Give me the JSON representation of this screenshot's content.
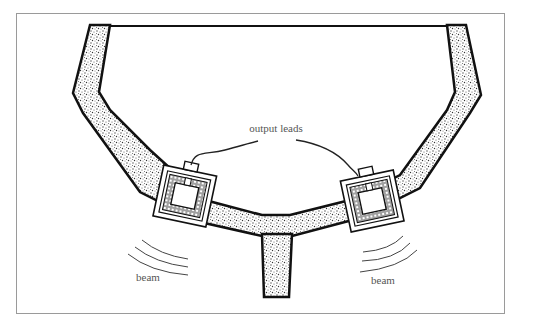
{
  "figure": {
    "labels": {
      "output_leads": "output leads",
      "beam_left": "beam",
      "beam_right": "beam"
    },
    "colors": {
      "outline": "#1a1a1a",
      "frame": "#9a9a9a",
      "stipple": "#8a8a8a",
      "label": "#555555"
    }
  },
  "caption": {
    "text": ""
  }
}
